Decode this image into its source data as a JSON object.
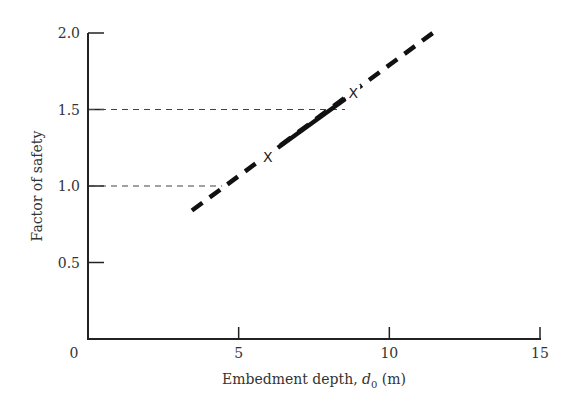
{
  "chart_data": {
    "type": "line",
    "title": "",
    "xlabel": "Embedment depth, d0 (m)",
    "xlabel_parts": {
      "main": "Embedment depth, ",
      "var": "d",
      "sub": "0",
      "unit": " (m)"
    },
    "ylabel": "Factor of safety",
    "xlim": [
      0,
      15
    ],
    "ylim": [
      0,
      2.0
    ],
    "x_ticks": [
      0,
      5,
      10,
      15
    ],
    "x_tick_labels": [
      "0",
      "5",
      "10",
      "15"
    ],
    "y_ticks": [
      0.5,
      1.0,
      1.5,
      2.0
    ],
    "y_tick_labels": [
      "0.5",
      "1.0",
      "1.5",
      "2.0"
    ],
    "grid": false,
    "legend": null,
    "series": [
      {
        "name": "Factor of safety vs embedment depth (dashed, thick)",
        "style": "dashed",
        "x": [
          3.45,
          11.58
        ],
        "y": [
          0.84,
          2.02
        ]
      },
      {
        "name": "Design range (solid)",
        "style": "solid",
        "x": [
          6.3,
          8.55
        ],
        "y": [
          1.25,
          1.57
        ]
      }
    ],
    "markers": [
      {
        "label": "X",
        "x": 5.97,
        "y": 1.19
      },
      {
        "label": "X",
        "x": 8.8,
        "y": 1.61
      }
    ],
    "reference_lines": [
      {
        "orientation": "horizontal",
        "y": 1.5,
        "x_end": 8.53,
        "style": "thin-dashed"
      },
      {
        "orientation": "horizontal",
        "y": 1.0,
        "x_end": 4.45,
        "style": "thin-dashed"
      }
    ]
  }
}
